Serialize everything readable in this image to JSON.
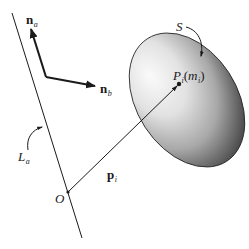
{
  "diagram": {
    "title": "",
    "labels": {
      "n_a": {
        "main": "n",
        "sub": "a"
      },
      "n_b": {
        "main": "n",
        "sub": "b"
      },
      "S": "S",
      "P_i": {
        "main": "P",
        "sub": "i",
        "paren_open": "(",
        "m": "m",
        "m_sub": "i",
        "paren_close": ")"
      },
      "L_a": {
        "main": "L",
        "sub": "a"
      },
      "p_i": {
        "main": "p",
        "sub": "i"
      },
      "O": "O"
    },
    "elements": {
      "line_La": {
        "x1": 12,
        "y1": 13,
        "x2": 82,
        "y2": 238
      },
      "origin_O": {
        "x": 68,
        "y": 192
      },
      "vector_na": {
        "x1": 46,
        "y1": 77,
        "x2": 31,
        "y2": 28
      },
      "vector_nb": {
        "x1": 46,
        "y1": 77,
        "x2": 96,
        "y2": 86
      },
      "body_S": {
        "cx": 187,
        "cy": 100,
        "rx": 50,
        "ry": 73,
        "rotation_deg": -33
      },
      "point_Pi": {
        "x": 179,
        "y": 84
      },
      "vector_pi": {
        "x1": 68,
        "y1": 192,
        "x2": 179,
        "y2": 84
      }
    },
    "colors": {
      "stroke": "#1a1a1a",
      "background": "#ffffff",
      "body_highlight": "#f4f4f4",
      "body_shadow": "#3a3a3a"
    }
  }
}
